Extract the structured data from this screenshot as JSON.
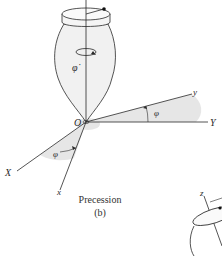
{
  "figure": {
    "caption_title": "Precession",
    "caption_label": "(b)",
    "labels": {
      "origin": "O",
      "phi_dot": "φ̇",
      "phi_angle_upper": "φ",
      "phi_angle_lower": "φ",
      "axis_y_body": "y",
      "axis_Y_fixed": "Y",
      "axis_X_fixed": "X",
      "axis_x_body": "x",
      "axis_z_partial": "z"
    },
    "colors": {
      "line": "#2a2a2a",
      "top_fill": "#ececec",
      "shade": "#e3e3e3",
      "background": "#ffffff"
    }
  }
}
